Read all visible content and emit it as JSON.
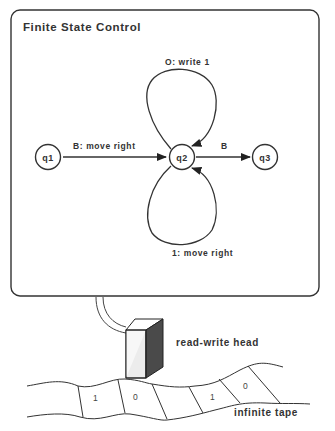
{
  "title": "Finite State Control",
  "states": [
    {
      "id": "q1",
      "label": "q1"
    },
    {
      "id": "q2",
      "label": "q2"
    },
    {
      "id": "q3",
      "label": "q3"
    }
  ],
  "transitions": [
    {
      "from": "q1",
      "to": "q2",
      "label": "B: move right"
    },
    {
      "from": "q2",
      "to": "q2",
      "label": "O: write 1",
      "position": "top-loop"
    },
    {
      "from": "q2",
      "to": "q2",
      "label": "1: move right",
      "position": "bottom-loop"
    },
    {
      "from": "q2",
      "to": "q3",
      "label": "B"
    }
  ],
  "head": {
    "label": "read-write head"
  },
  "tape": {
    "label": "infinite tape",
    "cells": [
      "1",
      "0",
      "",
      "1",
      "0"
    ]
  }
}
